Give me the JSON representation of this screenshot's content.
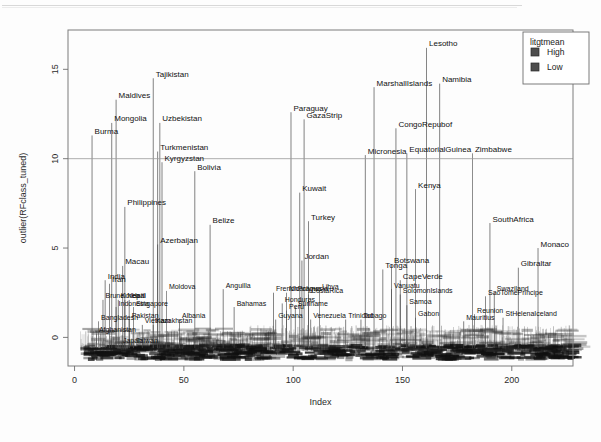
{
  "chart_data": {
    "type": "scatter",
    "title": "",
    "xlabel": "Index",
    "ylabel": "outlier(RFclass_tuned)",
    "xlim": [
      -3,
      228
    ],
    "ylim": [
      -1.6,
      17.2
    ],
    "xticks": [
      0,
      50,
      100,
      150,
      200
    ],
    "yticks": [
      0,
      5,
      10,
      15
    ],
    "grid": false,
    "hline": 10,
    "legend": {
      "title": "litgtmean",
      "position": "top-right",
      "entries": [
        {
          "label": "High",
          "color": "#4d4d4d"
        },
        {
          "label": "Low",
          "color": "#4d4d4d"
        }
      ]
    },
    "labeled_points": [
      {
        "name": "Burma",
        "x": 8,
        "y": 11.3
      },
      {
        "name": "Mongolia",
        "x": 17,
        "y": 12.0
      },
      {
        "name": "Maldives",
        "x": 19,
        "y": 13.3
      },
      {
        "name": "Tajikistan",
        "x": 36,
        "y": 14.5
      },
      {
        "name": "Uzbekistan",
        "x": 39,
        "y": 12.0
      },
      {
        "name": "Turkmenistan",
        "x": 38,
        "y": 10.4
      },
      {
        "name": "Kyrgyzstan",
        "x": 40,
        "y": 9.8
      },
      {
        "name": "Bolivia",
        "x": 55,
        "y": 9.3
      },
      {
        "name": "Philippines",
        "x": 23,
        "y": 7.3
      },
      {
        "name": "Belize",
        "x": 62,
        "y": 6.3
      },
      {
        "name": "Azerbaijan",
        "x": 38,
        "y": 5.2
      },
      {
        "name": "Macau",
        "x": 22,
        "y": 4.0
      },
      {
        "name": "India",
        "x": 14,
        "y": 3.2
      },
      {
        "name": "Iran",
        "x": 16,
        "y": 3.0
      },
      {
        "name": "Moldova",
        "x": 42,
        "y": 2.6
      },
      {
        "name": "Anguilla",
        "x": 68,
        "y": 2.7
      },
      {
        "name": "Brunei",
        "x": 13,
        "y": 2.1
      },
      {
        "name": "Korea",
        "x": 20,
        "y": 2.1
      },
      {
        "name": "Nepal",
        "x": 23,
        "y": 2.1
      },
      {
        "name": "Haiti",
        "x": 25,
        "y": 2.1
      },
      {
        "name": "Indonesia",
        "x": 19,
        "y": 1.7
      },
      {
        "name": "Singapore",
        "x": 27,
        "y": 1.7
      },
      {
        "name": "Bahamas",
        "x": 73,
        "y": 1.7
      },
      {
        "name": "Bangladesh",
        "x": 11,
        "y": 0.9
      },
      {
        "name": "Pakistan",
        "x": 25,
        "y": 1.0
      },
      {
        "name": "Vietnam",
        "x": 31,
        "y": 0.7
      },
      {
        "name": "Kazakhstan",
        "x": 36,
        "y": 0.7
      },
      {
        "name": "Albania",
        "x": 48,
        "y": 1.0
      },
      {
        "name": "Afghanistan",
        "x": 10,
        "y": 0.2
      },
      {
        "name": "Japan",
        "x": 21,
        "y": -0.4
      },
      {
        "name": "Taiwan",
        "x": 27,
        "y": -0.4
      },
      {
        "name": "Paraguay",
        "x": 99,
        "y": 12.6
      },
      {
        "name": "GazaStrip",
        "x": 105,
        "y": 12.2
      },
      {
        "name": "Kuwait",
        "x": 103,
        "y": 8.1
      },
      {
        "name": "Turkey",
        "x": 107,
        "y": 6.5
      },
      {
        "name": "Jordan",
        "x": 104,
        "y": 4.3
      },
      {
        "name": "FrenchPolynesia",
        "x": 91,
        "y": 2.5
      },
      {
        "name": "Nicaragua",
        "x": 97,
        "y": 2.5
      },
      {
        "name": "Libya",
        "x": 112,
        "y": 2.6
      },
      {
        "name": "CostaRica",
        "x": 107,
        "y": 2.4
      },
      {
        "name": "Honduras",
        "x": 95,
        "y": 1.9
      },
      {
        "name": "Suriname",
        "x": 101,
        "y": 1.7
      },
      {
        "name": "Peru",
        "x": 97,
        "y": 1.5
      },
      {
        "name": "Guyana",
        "x": 92,
        "y": 1.0
      },
      {
        "name": "Venezuela",
        "x": 108,
        "y": 1.0
      },
      {
        "name": "Trinidad",
        "x": 124,
        "y": 1.0
      },
      {
        "name": "Tobago",
        "x": 131,
        "y": 1.0
      },
      {
        "name": "Micronesia",
        "x": 133,
        "y": 10.2
      },
      {
        "name": "MarshallIslands",
        "x": 137,
        "y": 14.0
      },
      {
        "name": "CongoRepubof",
        "x": 147,
        "y": 11.7
      },
      {
        "name": "EquatorialGuinea",
        "x": 152,
        "y": 10.3
      },
      {
        "name": "Lesotho",
        "x": 161,
        "y": 16.2
      },
      {
        "name": "Namibia",
        "x": 167,
        "y": 14.2
      },
      {
        "name": "Zimbabwe",
        "x": 182,
        "y": 10.3
      },
      {
        "name": "Kenya",
        "x": 156,
        "y": 8.3
      },
      {
        "name": "Botswana",
        "x": 145,
        "y": 4.1
      },
      {
        "name": "Tonga",
        "x": 141,
        "y": 3.8
      },
      {
        "name": "CapeVerde",
        "x": 149,
        "y": 3.2
      },
      {
        "name": "Vanuatu",
        "x": 145,
        "y": 2.7
      },
      {
        "name": "SolomonIslands",
        "x": 149,
        "y": 2.4
      },
      {
        "name": "Samoa",
        "x": 152,
        "y": 1.8
      },
      {
        "name": "Gabon",
        "x": 156,
        "y": 1.1
      },
      {
        "name": "SouthAfrica",
        "x": 190,
        "y": 6.4
      },
      {
        "name": "Monaco",
        "x": 212,
        "y": 5.0
      },
      {
        "name": "Gibraltar",
        "x": 203,
        "y": 3.9
      },
      {
        "name": "Swaziland",
        "x": 192,
        "y": 2.5
      },
      {
        "name": "SaoTomePrincipe",
        "x": 188,
        "y": 2.3
      },
      {
        "name": "Reunion",
        "x": 183,
        "y": 1.3
      },
      {
        "name": "StHelenaIceland",
        "x": 196,
        "y": 1.1
      },
      {
        "name": "Mauritius",
        "x": 178,
        "y": 0.9
      }
    ]
  },
  "plot": {
    "y_axis_label": "outlier(RFclass_tuned)",
    "x_axis_label": "Index",
    "x_tick_labels": [
      "0",
      "50",
      "100",
      "150",
      "200"
    ],
    "y_tick_labels": [
      "0",
      "5",
      "10",
      "15"
    ]
  },
  "legend": {
    "title": "litgtmean",
    "item_high": "High",
    "item_low": "Low"
  }
}
